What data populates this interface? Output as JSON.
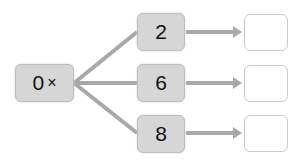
{
  "diagram": {
    "source": {
      "value": "0",
      "operator": "×"
    },
    "branches": [
      {
        "multiplier": "2",
        "answer": ""
      },
      {
        "multiplier": "6",
        "answer": ""
      },
      {
        "multiplier": "8",
        "answer": ""
      }
    ]
  },
  "colors": {
    "box_fill": "#d6d6d6",
    "box_border": "#bdbdbd",
    "line": "#a8a8a8",
    "answer_border": "#c9c9c9"
  }
}
